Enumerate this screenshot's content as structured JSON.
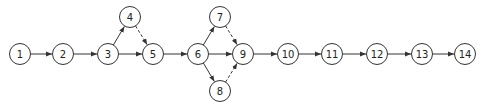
{
  "diagram": {
    "type": "network-graph",
    "node_radius": 10.5,
    "stroke_color": "#333333",
    "nodes": [
      {
        "id": "1",
        "label": "1",
        "x": 20,
        "y": 54
      },
      {
        "id": "2",
        "label": "2",
        "x": 63,
        "y": 54
      },
      {
        "id": "3",
        "label": "3",
        "x": 108,
        "y": 54
      },
      {
        "id": "4",
        "label": "4",
        "x": 130,
        "y": 17
      },
      {
        "id": "5",
        "label": "5",
        "x": 153,
        "y": 54
      },
      {
        "id": "6",
        "label": "6",
        "x": 198,
        "y": 54
      },
      {
        "id": "7",
        "label": "7",
        "x": 220,
        "y": 17
      },
      {
        "id": "8",
        "label": "8",
        "x": 220,
        "y": 91
      },
      {
        "id": "9",
        "label": "9",
        "x": 243,
        "y": 54
      },
      {
        "id": "10",
        "label": "10",
        "x": 288,
        "y": 54
      },
      {
        "id": "11",
        "label": "11",
        "x": 332,
        "y": 54
      },
      {
        "id": "12",
        "label": "12",
        "x": 377,
        "y": 54
      },
      {
        "id": "13",
        "label": "13",
        "x": 422,
        "y": 54
      },
      {
        "id": "14",
        "label": "14",
        "x": 465,
        "y": 54
      }
    ],
    "edges": [
      {
        "from": "1",
        "to": "2",
        "style": "solid"
      },
      {
        "from": "2",
        "to": "3",
        "style": "solid"
      },
      {
        "from": "3",
        "to": "4",
        "style": "solid"
      },
      {
        "from": "3",
        "to": "5",
        "style": "solid"
      },
      {
        "from": "4",
        "to": "5",
        "style": "dashed"
      },
      {
        "from": "5",
        "to": "6",
        "style": "solid"
      },
      {
        "from": "6",
        "to": "7",
        "style": "solid"
      },
      {
        "from": "6",
        "to": "9",
        "style": "solid"
      },
      {
        "from": "6",
        "to": "8",
        "style": "solid"
      },
      {
        "from": "7",
        "to": "9",
        "style": "dashed"
      },
      {
        "from": "8",
        "to": "9",
        "style": "dashed"
      },
      {
        "from": "9",
        "to": "10",
        "style": "solid"
      },
      {
        "from": "10",
        "to": "11",
        "style": "solid"
      },
      {
        "from": "11",
        "to": "12",
        "style": "solid"
      },
      {
        "from": "12",
        "to": "13",
        "style": "solid"
      },
      {
        "from": "13",
        "to": "14",
        "style": "solid"
      }
    ]
  }
}
